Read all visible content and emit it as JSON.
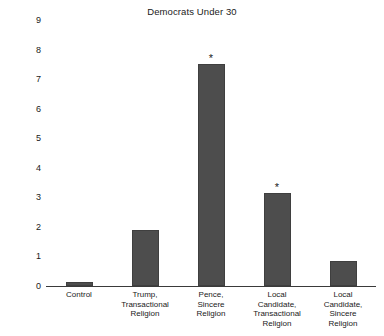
{
  "chart_data": {
    "type": "bar",
    "title": "Democrats Under 30",
    "xlabel": "",
    "ylabel": "Increase in Percentage With No Religious Identity",
    "ylim": [
      0,
      9
    ],
    "yticks": [
      0,
      1,
      2,
      3,
      4,
      5,
      6,
      7,
      8,
      9
    ],
    "ytick_labels": [
      "0",
      "1",
      "2",
      "3",
      "4",
      "5",
      "6",
      "7",
      "8",
      "9"
    ],
    "grid": false,
    "legend": "none",
    "bar_color": "#4d4d4d",
    "categories": [
      "Control",
      "Trump, Transactional Religion",
      "Pence, Sincere Religion",
      "Local Candidate, Transactional Religion",
      "Local Candidate, Sincere Religion"
    ],
    "category_lines": [
      [
        "Control"
      ],
      [
        "Trump,",
        "Transactional",
        "Religion"
      ],
      [
        "Pence,",
        "Sincere",
        "Religion"
      ],
      [
        "Local",
        "Candidate,",
        "Transactional",
        "Religion"
      ],
      [
        "Local",
        "Candidate,",
        "Sincere",
        "Religion"
      ]
    ],
    "values": [
      0.15,
      1.9,
      7.5,
      3.15,
      0.85
    ],
    "annotations": [
      {
        "category": "Pence, Sincere Religion",
        "marker": "*"
      },
      {
        "category": "Local Candidate, Transactional Religion",
        "marker": "*"
      }
    ],
    "significance_marker": "*"
  }
}
